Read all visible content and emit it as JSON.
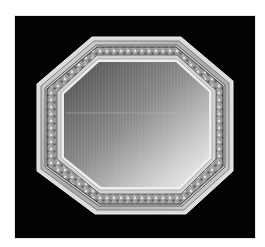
{
  "image": {
    "subject": "Octagonal ornate carved frame mirror",
    "description": "Black-and-white photograph of an octagonal mirror with a carved, silvered/gilt wooden frame, displayed on a black background inside a white margin.",
    "colors": {
      "page_background": "#ffffff",
      "photo_background": "#030303",
      "frame_light": "#e8e8e8",
      "frame_mid": "#b4b4b4",
      "frame_dark": "#5a5a5a",
      "mirror_dark": "#5c5c5c",
      "mirror_light": "#f2f2f2"
    },
    "objects": [
      {
        "name": "outer-frame",
        "shape": "octagon"
      },
      {
        "name": "carved-band",
        "shape": "octagon"
      },
      {
        "name": "inner-molding",
        "shape": "octagon"
      },
      {
        "name": "mirror-glass",
        "shape": "octagon"
      }
    ]
  }
}
